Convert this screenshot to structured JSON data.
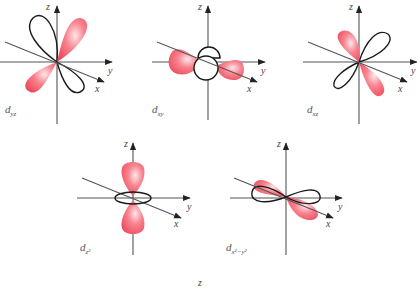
{
  "figure": {
    "title": "",
    "colors": {
      "lobe_fill": "#f25a6a",
      "lobe_highlight": "#ffe6ea",
      "lobe_outline": "#1a1a1a",
      "axis": "#555555",
      "background": "#ffffff"
    },
    "axis_labels": {
      "x": "x",
      "y": "y",
      "z": "z"
    },
    "orbitals": [
      {
        "id": "dyz",
        "label_main": "d",
        "label_sub": "yz"
      },
      {
        "id": "dxy",
        "label_main": "d",
        "label_sub": "xy"
      },
      {
        "id": "dxz",
        "label_main": "d",
        "label_sub": "xz"
      },
      {
        "id": "dz2",
        "label_main": "d",
        "label_sub": "z²"
      },
      {
        "id": "dx2y2",
        "label_main": "d",
        "label_sub": "x²−y²"
      }
    ],
    "stray_label": "z"
  }
}
